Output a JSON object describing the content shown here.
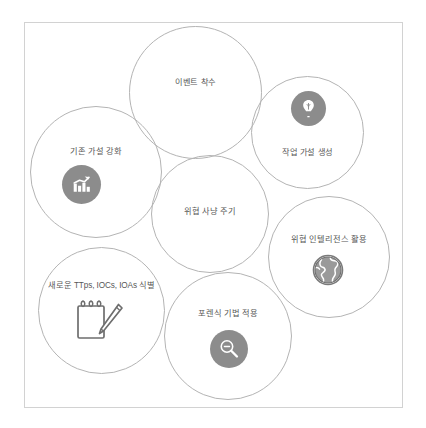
{
  "diagram": {
    "title": "위협 사냥 주기",
    "frame": {
      "border_color": "#d2d2d2",
      "background": "#ffffff"
    },
    "style": {
      "circle_stroke": "#b4b4b4",
      "label_color": "#575757",
      "icon_disc_color": "#8c8c8c",
      "icon_glyph_color": "#ffffff",
      "clipboard_color": "#6e6e6e"
    },
    "nodes": [
      {
        "id": "event-initiation",
        "label": "이벤트 착수",
        "icon": "none"
      },
      {
        "id": "hypothesis-generation",
        "label": "작업 가설 생성",
        "icon": "lightbulb-icon"
      },
      {
        "id": "hypothesis-reinforcement",
        "label": "기존 가설 강화",
        "icon": "bar-chart-arrow-icon"
      },
      {
        "id": "hunting-cycle",
        "label": "위협 사냥 주기",
        "icon": "none"
      },
      {
        "id": "threat-intelligence",
        "label": "위협 인텔리전스 활용",
        "icon": "globe-icon"
      },
      {
        "id": "identify-ttps",
        "label": "새로운 TTps, IOCs, IOAs 식별",
        "icon": "clipboard-pencil-icon"
      },
      {
        "id": "forensics",
        "label": "포렌식 기법 적용",
        "icon": "magnifier-icon"
      }
    ]
  }
}
